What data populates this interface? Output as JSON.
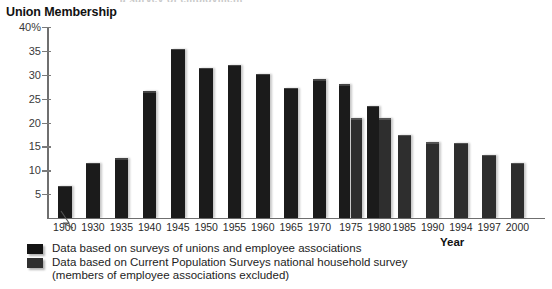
{
  "top_sliver": "a survey of employment",
  "chart_data": {
    "type": "bar",
    "title": "Union Membership",
    "xlabel": "Year",
    "ylabel": "",
    "ylim": [
      0,
      40
    ],
    "ytick_values": [
      5,
      10,
      15,
      20,
      25,
      30,
      35,
      40
    ],
    "ytick_labels": [
      "5",
      "10",
      "15",
      "20",
      "25",
      "30",
      "35",
      "40%"
    ],
    "grid": false,
    "axis_break_between": [
      "1900",
      "1930"
    ],
    "categories": [
      "1900",
      "1930",
      "1935",
      "1940",
      "1945",
      "1950",
      "1955",
      "1960",
      "1965",
      "1970",
      "1975",
      "1980",
      "1985",
      "1990",
      "1994",
      "1997",
      "2000"
    ],
    "series": [
      {
        "name": "Data based on surveys of unions and employee associations",
        "key": "unions",
        "color": "#1b1b1b",
        "values": [
          6.8,
          11.6,
          12.5,
          26.6,
          35.5,
          31.5,
          32.1,
          30.2,
          27.3,
          29.1,
          28.0,
          23.5,
          null,
          null,
          null,
          null,
          null
        ]
      },
      {
        "name": "Data based on Current Population Surveys national household survey (members of employee associations excluded)",
        "key": "cps",
        "color": "#2e2e2e",
        "values": [
          null,
          null,
          null,
          null,
          null,
          null,
          null,
          null,
          null,
          null,
          20.9,
          20.9,
          17.4,
          15.9,
          15.8,
          13.2,
          11.6
        ]
      }
    ],
    "legend_position": "below-axis"
  },
  "legend": {
    "items": [
      {
        "label": "Data based on surveys of unions and employee associations",
        "swatch": "unions"
      },
      {
        "label": "Data based on Current Population Surveys national household survey",
        "swatch": "cps",
        "continuation": "(members of employee associations excluded)"
      }
    ]
  }
}
